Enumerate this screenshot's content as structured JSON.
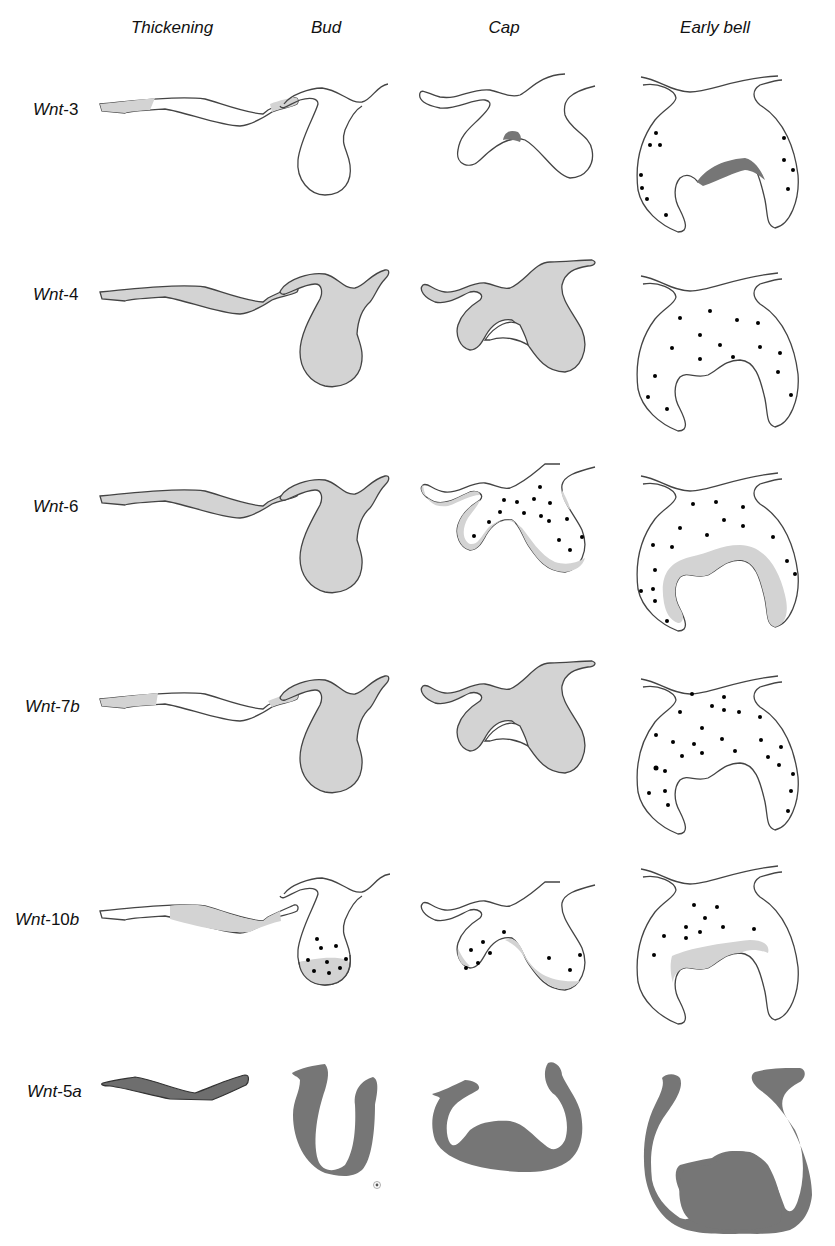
{
  "figure": {
    "columns": [
      {
        "label": "Thickening",
        "x": 172
      },
      {
        "label": "Bud",
        "x": 326
      },
      {
        "label": "Cap",
        "x": 504
      },
      {
        "label": "Early bell",
        "x": 715
      }
    ],
    "rows": [
      {
        "gene_prefix": "Wnt",
        "gene_suffix": "-3",
        "suffix_italic": false,
        "y": 100,
        "thickening": "partial shading at both ends",
        "bud": "unstained",
        "cap": "small dark patch at enamel knot",
        "early_bell": "dark band in enamel knot region + scattered mesenchyme dots"
      },
      {
        "gene_prefix": "Wnt",
        "gene_suffix": "-4",
        "suffix_italic": false,
        "y": 285,
        "thickening": "uniformly shaded",
        "bud": "uniformly shaded",
        "cap": "epithelium uniformly shaded",
        "early_bell": "scattered mesenchyme dots"
      },
      {
        "gene_prefix": "Wnt",
        "gene_suffix": "-6",
        "suffix_italic": false,
        "y": 480,
        "thickening": "uniformly shaded",
        "bud": "uniformly shaded",
        "cap": "peripheral shading + mesenchyme dots",
        "early_bell": "inner epithelium band + dots"
      },
      {
        "gene_prefix": "Wnt",
        "gene_suffix": "-7",
        "suffix_sub": "b",
        "suffix_italic": true,
        "y": 690,
        "thickening": "partial shading at both ends",
        "bud": "uniformly shaded",
        "cap": "epithelium uniformly shaded",
        "early_bell": "scattered mesenchyme dots"
      },
      {
        "gene_prefix": "Wnt",
        "gene_suffix": "-10",
        "suffix_sub": "b",
        "suffix_italic": true,
        "y": 885,
        "thickening": "middle shading",
        "bud": "basal shading + dots",
        "cap": "inner shading + dots",
        "early_bell": "inner epithelium band + dots"
      },
      {
        "gene_prefix": "Wnt",
        "gene_suffix": "-5",
        "suffix_sub": "a",
        "suffix_italic": true,
        "y": 1080,
        "thickening": "dark mesenchyme band",
        "bud": "dark mesenchyme U-shape",
        "cap": "dark mesenchyme + dental papilla",
        "early_bell": "dark mesenchyme + dental papilla"
      }
    ],
    "colors": {
      "light_expression": "#d3d3d3",
      "dark_expression": "#767676",
      "outline": "#444444",
      "dot": "#000000"
    }
  }
}
